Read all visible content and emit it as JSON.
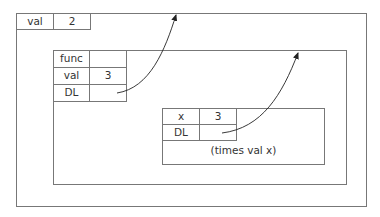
{
  "global_frame": {
    "bindings": [
      {
        "name": "val",
        "value": "2"
      }
    ]
  },
  "func_frame": {
    "bindings": [
      {
        "name": "func",
        "value": ""
      },
      {
        "name": "val",
        "value": "3"
      },
      {
        "name": "DL",
        "value": ""
      }
    ]
  },
  "call_frame": {
    "bindings": [
      {
        "name": "x",
        "value": "3"
      },
      {
        "name": "DL",
        "value": ""
      }
    ],
    "body": "(times val x)"
  },
  "colors": {
    "line": "#777777",
    "text": "#333333",
    "arrow": "#222222"
  }
}
